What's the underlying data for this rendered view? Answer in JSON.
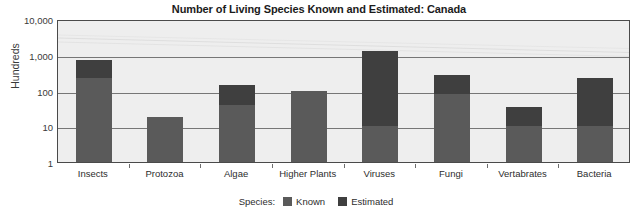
{
  "chart_data": {
    "type": "bar",
    "title": "Number of Living Species Known and Estimated: Canada",
    "xlabel": "",
    "ylabel": "Hundreds",
    "scale": "log",
    "ylim": [
      1,
      10000
    ],
    "grid": true,
    "stacked": true,
    "legend_position": "bottom",
    "legend_title": "Species:",
    "categories": [
      "Insects",
      "Protozoa",
      "Algae",
      "Higher Plants",
      "Viruses",
      "Fungi",
      "Vertabrates",
      "Bacteria"
    ],
    "ytick_labels": [
      "10,000",
      "1,000",
      "100",
      "10",
      "1"
    ],
    "ytick_values": [
      10000,
      1000,
      100,
      10,
      1
    ],
    "series": [
      {
        "name": "Known",
        "color": "#5a5a5a",
        "values": [
          220,
          18,
          40,
          95,
          10,
          80,
          10,
          10
        ]
      },
      {
        "name": "Estimated",
        "color": "#3f3f3f",
        "values": [
          700,
          18,
          140,
          95,
          1300,
          280,
          35,
          220
        ]
      }
    ],
    "totals": [
      700,
      18,
      140,
      95,
      1300,
      280,
      35,
      220
    ]
  },
  "legend": {
    "title": "Species:",
    "items": [
      {
        "label": "Known",
        "color": "#5a5a5a"
      },
      {
        "label": "Estimated",
        "color": "#3f3f3f"
      }
    ]
  }
}
